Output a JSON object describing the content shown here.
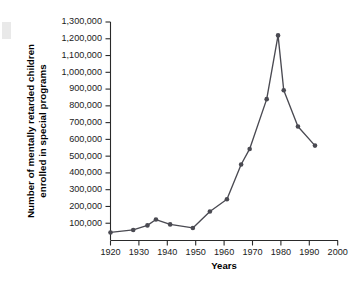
{
  "chart_data": {
    "type": "line",
    "title": "",
    "xlabel": "Years",
    "ylabel": "Number of mentally retarded children enrolled in special programs",
    "ylabel_line1": "Number of mentally retarded children",
    "ylabel_line2": "enrolled in special programs",
    "xlim": [
      1920,
      2000
    ],
    "ylim": [
      0,
      1300000
    ],
    "grid": false,
    "legend": null,
    "xticks": [
      1920,
      1930,
      1940,
      1950,
      1960,
      1970,
      1980,
      1990,
      2000
    ],
    "xtick_labels": [
      "1920",
      "1930",
      "1940",
      "1950",
      "1960",
      "1970",
      "1980",
      "1990",
      "2000"
    ],
    "yticks": [
      100000,
      200000,
      300000,
      400000,
      500000,
      600000,
      700000,
      800000,
      900000,
      1000000,
      1100000,
      1200000,
      1300000
    ],
    "ytick_labels": [
      "100,000",
      "200,000",
      "300,000",
      "400,000",
      "500,000",
      "600,000",
      "700,000",
      "800,000",
      "900,000",
      "1,000,000",
      "1,100,000",
      "1,200,000",
      "1,300,000"
    ],
    "series": [
      {
        "name": "Enrollment",
        "color": "#4a4a52",
        "marker": "circle",
        "x": [
          1920,
          1928,
          1933,
          1936,
          1941,
          1949,
          1955,
          1961,
          1966,
          1969,
          1975,
          1979,
          1981,
          1986,
          1992
        ],
        "y": [
          45000,
          60000,
          87000,
          122000,
          93000,
          72000,
          170000,
          243000,
          450000,
          543000,
          840000,
          1220000,
          893000,
          677000,
          563000
        ]
      }
    ]
  },
  "axes": {
    "x_axis_name": "years-axis",
    "y_axis_name": "enrollment-axis"
  }
}
